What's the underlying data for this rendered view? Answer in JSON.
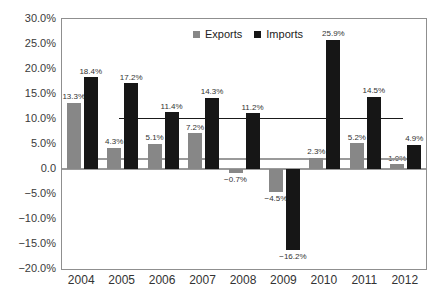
{
  "chart_data": {
    "type": "bar",
    "title": "",
    "xlabel": "",
    "ylabel": "",
    "categories": [
      "2004",
      "2005",
      "2006",
      "2007",
      "2008",
      "2009",
      "2010",
      "2011",
      "2012"
    ],
    "series": [
      {
        "name": "Exports",
        "color": "#878787",
        "values": [
          13.3,
          4.3,
          5.1,
          7.2,
          -0.7,
          -4.5,
          2.3,
          5.2,
          1.0
        ]
      },
      {
        "name": "Imports",
        "color": "#161616",
        "values": [
          18.4,
          17.2,
          11.4,
          14.3,
          11.2,
          -16.2,
          25.9,
          14.5,
          4.9
        ]
      }
    ],
    "data_label_suffix": "%",
    "ylim": [
      -20,
      30
    ],
    "yticks": [
      {
        "value": 30,
        "label": "30.0%"
      },
      {
        "value": 25,
        "label": "25.0%"
      },
      {
        "value": 20,
        "label": "20.0%"
      },
      {
        "value": 15,
        "label": "15.0%"
      },
      {
        "value": 10,
        "label": "10.0%"
      },
      {
        "value": 5,
        "label": "5.0%"
      },
      {
        "value": 0,
        "label": "0.0"
      },
      {
        "value": -5,
        "label": "−5.0%"
      },
      {
        "value": -10,
        "label": "−10.0%"
      },
      {
        "value": -15,
        "label": "−15.0%"
      },
      {
        "value": -20,
        "label": "−20.0%"
      }
    ],
    "grid": false,
    "legend_position": "top-center",
    "reference_lines": [
      {
        "name": "exports-average-line",
        "value": 2.0,
        "color": "#9a9a9a",
        "thickness": 2,
        "x_start_frac": 0.099,
        "x_end_frac": 0.959
      },
      {
        "name": "imports-average-line",
        "value": 10.1,
        "color": "#1a1a1a",
        "thickness": 1.6,
        "x_start_frac": 0.157,
        "x_end_frac": 0.937
      }
    ],
    "axis_color": "#8f8f8f",
    "zero_line_color": "#9a9a9a",
    "label_color": "#333333"
  }
}
